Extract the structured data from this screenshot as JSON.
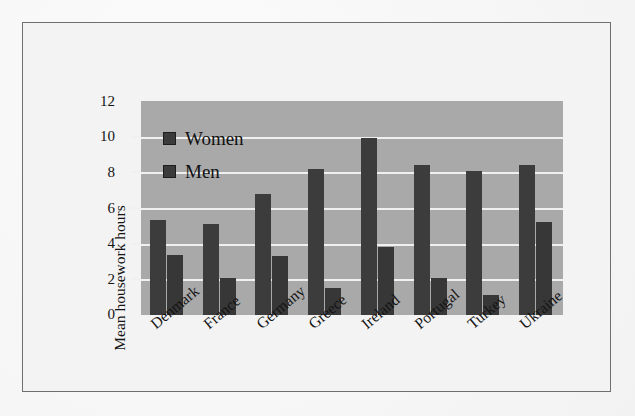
{
  "chart_data": {
    "type": "bar",
    "title": "",
    "xlabel": "",
    "ylabel": "Mean housework hours",
    "ylim": [
      0,
      12
    ],
    "yticks": [
      "0",
      "2",
      "4",
      "6",
      "8",
      "10",
      "12"
    ],
    "grid": true,
    "legend_position": "inside-top-left",
    "categories": [
      "Denmark",
      "France",
      "Germany",
      "Greece",
      "Ireland",
      "Portugal",
      "Turkey",
      "Ukraine"
    ],
    "series": [
      {
        "name": "Women",
        "color": "#3c3c3c",
        "values": [
          5.3,
          5.1,
          6.8,
          8.2,
          9.9,
          8.4,
          8.1,
          8.4
        ]
      },
      {
        "name": "Men",
        "color": "#373737",
        "values": [
          3.35,
          2.1,
          3.3,
          1.5,
          3.8,
          2.1,
          1.1,
          5.2
        ]
      }
    ]
  },
  "colors": {
    "plot_background": "#a9a9a9",
    "gridline": "#f0f0f0",
    "bar": "#3c3c3c",
    "frame_border": "#6f6f6f",
    "page_background": "#f3f3f3",
    "text": "#141414"
  }
}
